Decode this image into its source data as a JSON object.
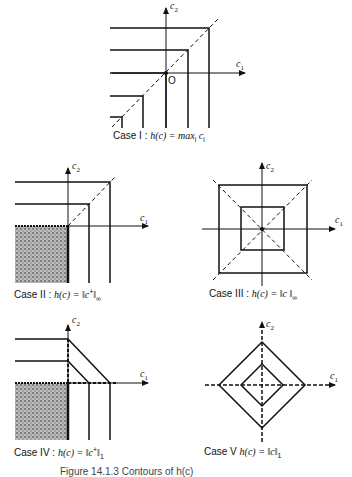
{
  "figure": {
    "caption": "Figure 14.1.3  Contours of h(c)",
    "axes": {
      "x_label": "c",
      "x_sub": "1",
      "y_label": "c",
      "y_sub": "2",
      "origin_label": "O"
    },
    "cases": [
      {
        "id": "I",
        "name": "Case I",
        "sep": ":",
        "formula": "h(c) = max",
        "formula_sub": "i",
        "formula_tail": " c",
        "formula_tail_sub": "i"
      },
      {
        "id": "II",
        "name": "Case II",
        "sep": ":",
        "formula": "h(c) = ‖c",
        "formula_sup": "+",
        "formula_end": "‖",
        "formula_sub": "∞"
      },
      {
        "id": "III",
        "name": "Case III",
        "sep": ":",
        "formula": "h(c) = ‖c ‖",
        "formula_sub": "∞"
      },
      {
        "id": "IV",
        "name": "Case IV",
        "sep": ":",
        "formula": "h(c) = ‖c",
        "formula_sup": "+",
        "formula_end": "‖",
        "formula_sub": "1"
      },
      {
        "id": "V",
        "name": "Case V",
        "sep": "",
        "formula": "h(c) = ‖c‖",
        "formula_sub": "1"
      }
    ]
  }
}
